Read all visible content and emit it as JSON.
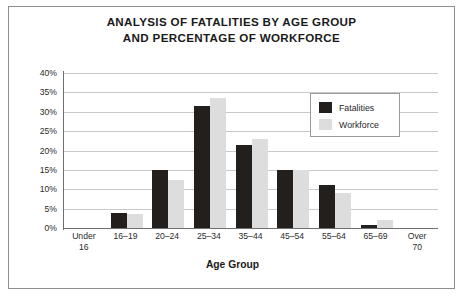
{
  "figure": {
    "title_lines": [
      "ANALYSIS OF FATALITIES BY AGE GROUP",
      "AND PERCENTAGE OF WORKFORCE"
    ],
    "border_color": "#8e8e8e",
    "background": "#ffffff"
  },
  "legend": {
    "position": "inside-top-right",
    "entries": [
      {
        "label": "Fatalities",
        "color": "#231f1c"
      },
      {
        "label": "Workforce",
        "color": "#dddddd"
      }
    ]
  },
  "chart_data": {
    "type": "bar",
    "title": "ANALYSIS OF FATALITIES BY AGE GROUP AND PERCENTAGE OF WORKFORCE",
    "xlabel": "Age Group",
    "ylabel": "",
    "ylim": [
      0,
      40
    ],
    "ytick_step": 5,
    "ytick_labels": [
      "40%",
      "35%",
      "30%",
      "25%",
      "20%",
      "15%",
      "10%",
      "5%",
      "0%"
    ],
    "ytick_values": [
      40,
      35,
      30,
      25,
      20,
      15,
      10,
      5,
      0
    ],
    "grid": true,
    "legend_position": "upper right",
    "categories": [
      "Under 16",
      "16–19",
      "20–24",
      "25–34",
      "35–44",
      "45–54",
      "55–64",
      "65–69",
      "Over 70"
    ],
    "category_label_lines": [
      [
        "Under",
        "16"
      ],
      [
        "16–19",
        ""
      ],
      [
        "20–24",
        ""
      ],
      [
        "25–34",
        ""
      ],
      [
        "35–44",
        ""
      ],
      [
        "45–54",
        ""
      ],
      [
        "55–64",
        ""
      ],
      [
        "65–69",
        ""
      ],
      [
        "Over",
        "70"
      ]
    ],
    "series": [
      {
        "name": "Fatalities",
        "color": "#231f1c",
        "values": [
          0,
          4,
          15,
          31.5,
          21.5,
          15,
          11,
          0.8,
          0
        ]
      },
      {
        "name": "Workforce",
        "color": "#dddddd",
        "values": [
          0,
          3.5,
          12.5,
          33.5,
          23,
          15,
          9,
          2,
          0
        ]
      }
    ]
  }
}
